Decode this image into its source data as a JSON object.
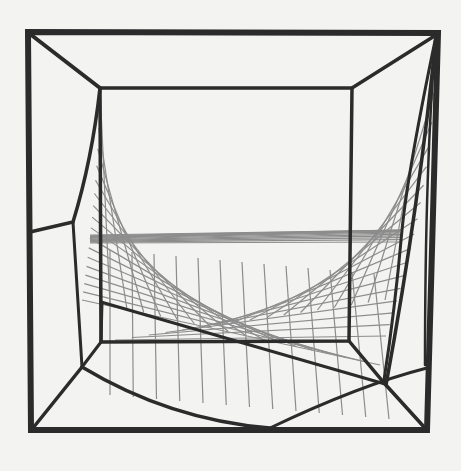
{
  "image": {
    "subject": "String-art sculpture: cube frame with hyperbolic string surface",
    "alt": "Black-and-white photo of a wireframe cube with strings forming a curved saddle surface",
    "colors": {
      "background": "#f3f3f1",
      "frame": "#2b2b2b",
      "strings": "#8c8c8c"
    }
  }
}
